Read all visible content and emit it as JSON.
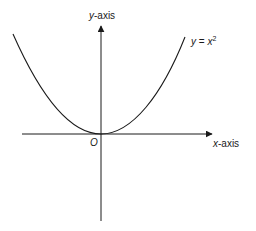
{
  "diagram": {
    "y_axis_label": {
      "var": "y",
      "suffix": "-axis"
    },
    "x_axis_label": {
      "var": "x",
      "suffix": "-axis"
    },
    "origin_label": "O",
    "curve_label": {
      "lhs": "y",
      "eq": " = ",
      "rhs": "x",
      "exp": "2"
    },
    "colors": {
      "stroke": "#1a1a1a",
      "background": "#ffffff"
    }
  }
}
